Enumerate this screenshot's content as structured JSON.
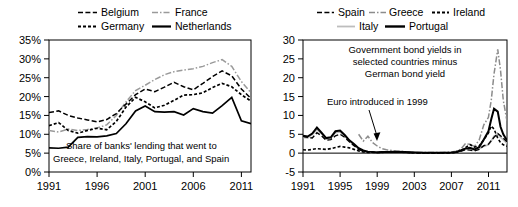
{
  "figure": {
    "panels": [
      {
        "id": "bank-lending-panel",
        "legend": [
          {
            "name": "Belgium",
            "style": "dashed",
            "color": "#000000"
          },
          {
            "name": "France",
            "style": "dash-dot",
            "color": "#9a9a9a"
          },
          {
            "name": "Germany",
            "style": "dotted",
            "color": "#000000"
          },
          {
            "name": "Netherlands",
            "style": "solid",
            "color": "#000000"
          }
        ],
        "annotation": [
          "Share of banks' lending that went to",
          "Greece, Ireland, Italy, Portugal, and Spain"
        ],
        "chart_data": {
          "type": "line",
          "title": "Share of banks' lending that went to Greece, Ireland, Italy, Portugal, and Spain",
          "xlabel": "",
          "ylabel": "",
          "xlim": [
            1991,
            2012
          ],
          "ylim": [
            0,
            35
          ],
          "xticks": [
            1991,
            1996,
            2001,
            2006,
            2011
          ],
          "yticks": [
            0,
            5,
            10,
            15,
            20,
            25,
            30,
            35
          ],
          "ytick_labels": [
            "0%",
            "5%",
            "10%",
            "15%",
            "20%",
            "25%",
            "30%",
            "35%"
          ],
          "grid": false,
          "legend_position": "above",
          "x": [
            1991,
            1992,
            1993,
            1994,
            1995,
            1996,
            1997,
            1998,
            1999,
            2000,
            2001,
            2002,
            2003,
            2004,
            2005,
            2006,
            2007,
            2008,
            2009,
            2010,
            2011,
            2012
          ],
          "series": [
            {
              "name": "Belgium",
              "values": [
                15.8,
                16.2,
                15.0,
                14.3,
                13.8,
                13.3,
                13.9,
                15.5,
                18.0,
                20.5,
                22.0,
                21.3,
                22.5,
                23.8,
                22.6,
                21.8,
                23.5,
                25.3,
                26.8,
                25.5,
                22.0,
                19.5
              ]
            },
            {
              "name": "France",
              "values": [
                11.0,
                10.6,
                11.4,
                11.0,
                11.3,
                11.7,
                12.5,
                15.0,
                18.6,
                21.6,
                23.0,
                24.5,
                25.8,
                26.6,
                27.0,
                27.4,
                28.0,
                29.0,
                29.8,
                28.0,
                24.0,
                21.0
              ]
            },
            {
              "name": "Germany",
              "values": [
                12.3,
                13.1,
                11.0,
                10.3,
                11.0,
                11.6,
                11.2,
                13.4,
                17.2,
                19.8,
                18.6,
                17.0,
                17.7,
                19.0,
                20.4,
                20.5,
                21.0,
                22.4,
                23.5,
                22.6,
                20.5,
                18.8
              ]
            },
            {
              "name": "Netherlands",
              "values": [
                6.4,
                6.3,
                6.6,
                9.2,
                9.4,
                9.3,
                9.6,
                10.2,
                12.8,
                16.2,
                17.5,
                16.0,
                15.9,
                16.0,
                15.1,
                16.8,
                16.0,
                15.6,
                17.6,
                19.8,
                13.6,
                12.8
              ]
            }
          ]
        }
      },
      {
        "id": "bond-spread-panel",
        "legend": [
          {
            "name": "Spain",
            "style": "dashed",
            "color": "#000000"
          },
          {
            "name": "Greece",
            "style": "dash-dot",
            "color": "#8c8c8c"
          },
          {
            "name": "Ireland",
            "style": "dotted",
            "color": "#000000"
          },
          {
            "name": "Italy",
            "style": "solid",
            "color": "#bdbdbd"
          },
          {
            "name": "Portugal",
            "style": "solid",
            "color": "#000000"
          }
        ],
        "annotation": [
          "Government bond yields in",
          "selected countries minus",
          "German bond yield"
        ],
        "arrow_label": "Euro introduced in 1999",
        "chart_data": {
          "type": "line",
          "title": "Government bond yields in selected countries minus German bond yield",
          "xlabel": "",
          "ylabel": "",
          "xlim": [
            1991,
            2013
          ],
          "ylim": [
            -5,
            30
          ],
          "xticks": [
            1991,
            1995,
            1999,
            2003,
            2007,
            2011
          ],
          "yticks": [
            -5,
            0,
            5,
            10,
            15,
            20,
            25,
            30
          ],
          "ytick_labels": [
            "-5",
            "0",
            "5",
            "10",
            "15",
            "20",
            "25",
            "30"
          ],
          "grid": false,
          "legend_position": "above",
          "annotations": [
            {
              "text": "Euro introduced in 1999",
              "x": 1999,
              "y": 12.5
            }
          ],
          "x": [
            1991.0,
            1991.5,
            1992.0,
            1992.5,
            1993.0,
            1993.5,
            1994.0,
            1994.5,
            1995.0,
            1995.5,
            1996.0,
            1996.5,
            1997.0,
            1997.5,
            1998.0,
            1998.5,
            1999.0,
            1999.5,
            2000.0,
            2001.0,
            2002.0,
            2003.0,
            2004.0,
            2005.0,
            2006.0,
            2007.0,
            2007.5,
            2008.0,
            2008.5,
            2009.0,
            2009.5,
            2010.0,
            2010.5,
            2011.0,
            2011.3,
            2011.6,
            2012.0,
            2012.3,
            2012.6,
            2013.0
          ],
          "series": [
            {
              "name": "Spain",
              "values": [
                4.4,
                4.2,
                4.0,
                5.4,
                4.6,
                3.4,
                3.6,
                4.6,
                5.0,
                4.2,
                3.0,
                2.0,
                1.0,
                0.5,
                0.3,
                0.2,
                0.2,
                0.3,
                0.3,
                0.3,
                0.2,
                0.1,
                0.0,
                0.0,
                0.0,
                0.1,
                0.2,
                0.5,
                0.9,
                0.8,
                0.6,
                1.0,
                2.0,
                2.4,
                3.3,
                4.2,
                5.2,
                4.6,
                4.0,
                3.0
              ]
            },
            {
              "name": "Greece",
              "values": [
                null,
                null,
                null,
                null,
                null,
                null,
                null,
                null,
                null,
                null,
                null,
                null,
                5.0,
                3.2,
                4.5,
                2.8,
                1.9,
                1.2,
                0.9,
                0.6,
                0.4,
                0.2,
                0.2,
                0.2,
                0.2,
                0.3,
                0.5,
                1.0,
                2.5,
                2.3,
                1.8,
                3.5,
                7.5,
                9.5,
                14.0,
                21.0,
                27.5,
                22.0,
                14.0,
                8.5
              ]
            },
            {
              "name": "Ireland",
              "values": [
                0.9,
                0.8,
                1.0,
                1.2,
                1.1,
                1.0,
                1.2,
                1.5,
                1.8,
                1.6,
                1.4,
                1.0,
                0.6,
                0.3,
                0.2,
                0.2,
                0.2,
                0.2,
                0.3,
                0.3,
                0.2,
                0.1,
                0.0,
                0.0,
                0.0,
                0.1,
                0.2,
                0.6,
                1.4,
                2.3,
                1.6,
                1.9,
                3.5,
                5.4,
                7.2,
                6.4,
                4.0,
                2.8,
                2.2,
                1.8
              ]
            },
            {
              "name": "Italy",
              "values": [
                4.2,
                4.0,
                5.0,
                6.2,
                5.2,
                3.8,
                4.0,
                5.4,
                5.6,
                4.6,
                3.2,
                2.2,
                1.2,
                0.6,
                0.3,
                0.2,
                0.2,
                0.3,
                0.3,
                0.4,
                0.3,
                0.2,
                0.1,
                0.1,
                0.1,
                0.2,
                0.3,
                0.6,
                1.0,
                1.2,
                0.8,
                1.2,
                1.8,
                2.2,
                3.2,
                4.5,
                5.0,
                4.2,
                3.6,
                2.6
              ]
            },
            {
              "name": "Portugal",
              "values": [
                4.6,
                4.4,
                5.2,
                6.8,
                5.4,
                4.0,
                4.2,
                5.8,
                6.0,
                4.8,
                3.4,
                2.4,
                1.3,
                0.7,
                0.4,
                0.3,
                0.2,
                0.3,
                0.3,
                0.4,
                0.3,
                0.2,
                0.1,
                0.1,
                0.1,
                0.2,
                0.3,
                0.7,
                1.2,
                1.4,
                1.0,
                1.6,
                3.6,
                5.8,
                9.0,
                11.8,
                11.0,
                7.0,
                5.0,
                3.4
              ]
            }
          ]
        }
      }
    ]
  }
}
